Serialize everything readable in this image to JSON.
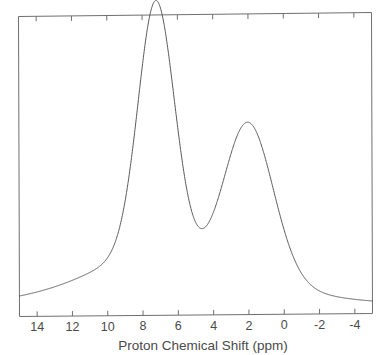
{
  "figure": {
    "background_color": "#ffffff",
    "line_color": "#5a5a5a",
    "frame_color": "#6f6f6f",
    "text_color": "#4a4a4a"
  },
  "chart_data": {
    "type": "line",
    "title": "",
    "subtitle": "",
    "xlabel": "Proton Chemical Shift (ppm)",
    "ylabel": "",
    "xlim": [
      15.0,
      -5.0
    ],
    "ylim": [
      0,
      1.0
    ],
    "x_axis_reversed": true,
    "grid": false,
    "legend": null,
    "legend_position": "none",
    "frame": "box",
    "tick_direction": "in",
    "x_ticks": [
      14,
      12,
      10,
      8,
      6,
      4,
      2,
      0,
      -2,
      -4
    ],
    "x_tick_labels": [
      "14",
      "12",
      "10",
      "8",
      "6",
      "4",
      "2",
      "0",
      "-2",
      "-4"
    ],
    "y_ticks": [],
    "y_tick_labels": [],
    "annotations": [],
    "peaks": [
      {
        "label": "peak-1",
        "center_ppm": 7.2,
        "height": 0.93,
        "fwhm_ppm": 2.45
      },
      {
        "label": "peak-2",
        "center_ppm": 2.0,
        "height": 0.58,
        "fwhm_ppm": 3.3
      }
    ],
    "baseline_tail": {
      "label": "broad-upfield-tail",
      "center_ppm": 9.5,
      "height": 0.1,
      "fwhm_ppm": 9.0
    },
    "valley": {
      "position_ppm": 4.3,
      "height": 0.2
    },
    "x": [
      15.0,
      14.5,
      14.0,
      13.5,
      13.0,
      12.5,
      12.0,
      11.5,
      11.0,
      10.5,
      10.0,
      9.5,
      9.0,
      8.5,
      8.0,
      7.8,
      7.6,
      7.4,
      7.2,
      7.0,
      6.8,
      6.6,
      6.4,
      6.2,
      6.0,
      5.5,
      5.0,
      4.5,
      4.3,
      4.0,
      3.5,
      3.0,
      2.5,
      2.2,
      2.0,
      1.8,
      1.5,
      1.0,
      0.5,
      0.0,
      -0.5,
      -1.0,
      -1.5,
      -2.0,
      -2.5,
      -3.0,
      -3.5,
      -4.0,
      -4.5,
      -5.0
    ],
    "y": [
      0.022,
      0.026,
      0.031,
      0.037,
      0.044,
      0.053,
      0.064,
      0.078,
      0.097,
      0.124,
      0.163,
      0.223,
      0.313,
      0.449,
      0.664,
      0.773,
      0.866,
      0.921,
      0.93,
      0.896,
      0.826,
      0.73,
      0.621,
      0.513,
      0.417,
      0.262,
      0.205,
      0.2,
      0.2,
      0.215,
      0.29,
      0.4,
      0.523,
      0.569,
      0.58,
      0.572,
      0.533,
      0.437,
      0.337,
      0.249,
      0.181,
      0.132,
      0.098,
      0.075,
      0.06,
      0.049,
      0.042,
      0.036,
      0.032,
      0.029
    ]
  }
}
